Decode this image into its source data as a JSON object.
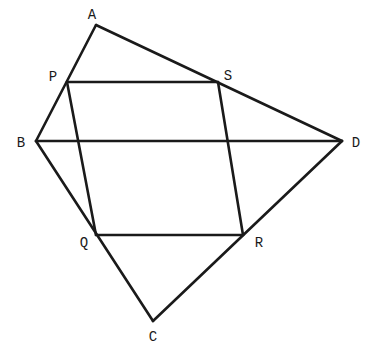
{
  "diagram": {
    "colors": {
      "stroke": "#1a1a1a",
      "background": "#ffffff"
    },
    "points": {
      "A": {
        "label": "A",
        "x": 96,
        "y": 25,
        "lx": 92,
        "ly": 15
      },
      "B": {
        "label": "B",
        "x": 36,
        "y": 141,
        "lx": 21,
        "ly": 143
      },
      "C": {
        "label": "C",
        "x": 153,
        "y": 321,
        "lx": 153,
        "ly": 337
      },
      "D": {
        "label": "D",
        "x": 342,
        "y": 141,
        "lx": 356,
        "ly": 143
      },
      "P": {
        "label": "P",
        "x": 67,
        "y": 82,
        "lx": 53,
        "ly": 77
      },
      "Q": {
        "label": "Q",
        "x": 96,
        "y": 235,
        "lx": 84,
        "ly": 243
      },
      "R": {
        "label": "R",
        "x": 243,
        "y": 235,
        "lx": 259,
        "ly": 243
      },
      "S": {
        "label": "S",
        "x": 218,
        "y": 82,
        "lx": 228,
        "ly": 76
      }
    },
    "edges": [
      [
        "A",
        "B"
      ],
      [
        "A",
        "D"
      ],
      [
        "B",
        "C"
      ],
      [
        "C",
        "D"
      ],
      [
        "B",
        "D"
      ],
      [
        "P",
        "S"
      ],
      [
        "S",
        "R"
      ],
      [
        "R",
        "Q"
      ],
      [
        "Q",
        "P"
      ]
    ]
  }
}
